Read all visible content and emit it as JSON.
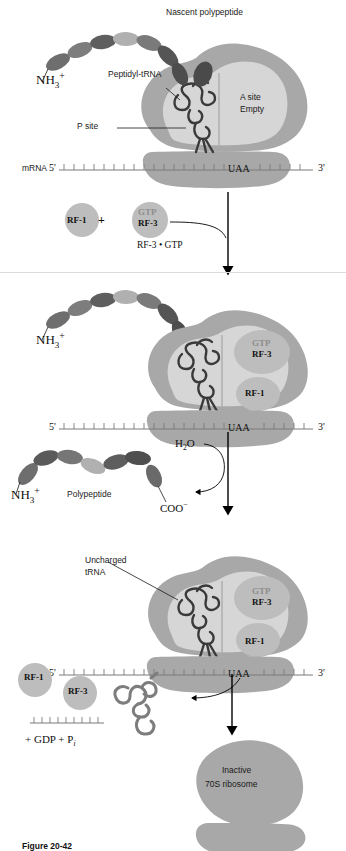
{
  "figure": {
    "caption": "Figure 20-42"
  },
  "colors": {
    "ribosome_large": "#a8a8a8",
    "ribosome_small": "#9f9f9f",
    "site_panel": "#d6d6d6",
    "trna_dark": "#3a3a3a",
    "trna_gray": "#6e6e6e",
    "peptide_dark": "#5a5a5a",
    "peptide_mid": "#7d7d7d",
    "peptide_light": "#b5b5b5",
    "rf_circle": "#bdbdbd",
    "gtp_text": "#8e8e8e",
    "mrna_line": "#7a7a7a",
    "arrow": "#000000"
  },
  "steps": [
    {
      "id": "step1",
      "labels": {
        "nascent": "Nascent polypeptide",
        "nh3": "NH3+",
        "peptidyl_trna": "Peptidyl-tRNA",
        "p_site": "P site",
        "a_site_line1": "A site",
        "a_site_line2": "Empty",
        "mrna": "mRNA",
        "five_prime": "5'",
        "three_prime": "3'",
        "codon": "UAA"
      }
    },
    {
      "id": "step2-reagents",
      "labels": {
        "rf1": "RF-1",
        "plus": "+",
        "gtp": "GTP",
        "rf3": "RF-3",
        "complex": "RF-3 • GTP"
      }
    },
    {
      "id": "step2",
      "labels": {
        "nh3": "NH3+",
        "gtp": "GTP",
        "rf3": "RF-3",
        "rf1": "RF-1",
        "five_prime": "5'",
        "three_prime": "3'",
        "codon": "UAA"
      }
    },
    {
      "id": "step3-reagents",
      "labels": {
        "nh3": "NH3+",
        "polypeptide": "Polypeptide",
        "coo": "COO−",
        "water": "H2O"
      }
    },
    {
      "id": "step3",
      "labels": {
        "uncharged_line1": "Uncharged",
        "uncharged_line2": "tRNA",
        "gtp": "GTP",
        "rf3": "RF-3",
        "rf1": "RF-1",
        "five_prime": "5'",
        "three_prime": "3'",
        "codon": "UAA"
      }
    },
    {
      "id": "step4",
      "labels": {
        "rf1": "RF-1",
        "rf3": "RF-3",
        "products": "+ GDP + Pi",
        "inactive_line1": "Inactive",
        "inactive_line2": "70S ribosome"
      }
    }
  ],
  "icons": {
    "down_arrow": "down-arrow-icon",
    "curved_arrow": "curved-arrow-icon",
    "leader_line": "leader-line-icon"
  }
}
